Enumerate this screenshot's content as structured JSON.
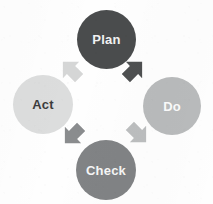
{
  "diagram": {
    "type": "cycle-diagram",
    "background_color": "#fefefe",
    "direction": "clockwise",
    "nodes": [
      {
        "id": "plan",
        "label": "Plan",
        "position": "top",
        "fill_color": "#4a4c4d",
        "text_color": "#f2f2f2"
      },
      {
        "id": "do",
        "label": "Do",
        "position": "right",
        "fill_color": "#b9bbbc",
        "text_color": "#fbfbfb"
      },
      {
        "id": "check",
        "label": "Check",
        "position": "bottom",
        "fill_color": "#818385",
        "text_color": "#f6f6f6"
      },
      {
        "id": "act",
        "label": "Act",
        "position": "left",
        "fill_color": "#dcdddd",
        "text_color": "#3b3c3d"
      }
    ],
    "arrows": [
      {
        "id": "plan-to-do",
        "from": "plan",
        "to": "do",
        "fill_color": "#4e5051"
      },
      {
        "id": "do-to-check",
        "from": "do",
        "to": "check",
        "fill_color": "#bcbebf"
      },
      {
        "id": "check-to-act",
        "from": "check",
        "to": "act",
        "fill_color": "#8a8c8e"
      },
      {
        "id": "act-to-plan",
        "from": "act",
        "to": "plan",
        "fill_color": "#d5d6d6"
      }
    ]
  }
}
